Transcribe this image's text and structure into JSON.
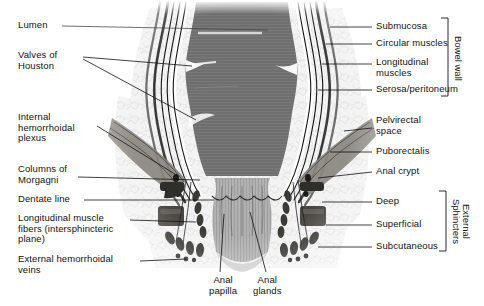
{
  "figure": {
    "background_color": "#ffffff",
    "ink_color": "#121212"
  },
  "labels_left": [
    {
      "id": "lumen",
      "text": "Lumen",
      "x": 18,
      "y": 22
    },
    {
      "id": "valves-of-houston",
      "text": "Valves of\nHouston",
      "x": 18,
      "y": 53
    },
    {
      "id": "internal-hemorrhoidal-plexus",
      "text": "Internal\nhemorrhoidal\nplexus",
      "x": 18,
      "y": 114
    },
    {
      "id": "columns-of-morgagni",
      "text": "Columns of\nMorgagni",
      "x": 18,
      "y": 166
    },
    {
      "id": "dentate-line",
      "text": "Dentate line",
      "x": 18,
      "y": 196
    },
    {
      "id": "longitudinal-muscle-fibers",
      "text": "Longitudinal muscle\nfibers (intersphincteric\nplane)",
      "x": 18,
      "y": 215
    },
    {
      "id": "external-hemorrhoidal-veins",
      "text": "External hemorrhoidal\nveins",
      "x": 18,
      "y": 256
    }
  ],
  "labels_right": [
    {
      "id": "submucosa",
      "text": "Submucosa",
      "x": 376,
      "y": 22
    },
    {
      "id": "circular-muscles",
      "text": "Circular muscles",
      "x": 376,
      "y": 39
    },
    {
      "id": "longitudinal-muscles",
      "text": "Longitudinal\nmuscles",
      "x": 376,
      "y": 58
    },
    {
      "id": "serosa-peritoneum",
      "text": "Serosa/peritoneum",
      "x": 376,
      "y": 85
    },
    {
      "id": "pelvirectal-space",
      "text": "Pelvirectal\nspace",
      "x": 376,
      "y": 116
    },
    {
      "id": "puborectalis",
      "text": "Puborectalis",
      "x": 376,
      "y": 147
    },
    {
      "id": "anal-crypt",
      "text": "Anal crypt",
      "x": 376,
      "y": 167
    },
    {
      "id": "deep",
      "text": "Deep",
      "x": 376,
      "y": 197
    },
    {
      "id": "superficial",
      "text": "Superficial",
      "x": 376,
      "y": 220
    },
    {
      "id": "subcutaneous",
      "text": "Subcutaneous",
      "x": 376,
      "y": 242
    }
  ],
  "labels_bottom": [
    {
      "id": "anal-papilla",
      "text": "Anal\npapilla",
      "x": 209,
      "y": 277
    },
    {
      "id": "anal-glands",
      "text": "Anal\nglands",
      "x": 253,
      "y": 277
    }
  ],
  "brackets": [
    {
      "id": "bowel-wall",
      "text": "Bowel wall",
      "x": 452,
      "y": 18,
      "height": 78
    },
    {
      "id": "external-sphincters",
      "text": "External\nSphincters",
      "x": 450,
      "y": 191,
      "height": 60
    }
  ],
  "colors": {
    "lumen_fill": "#6f6f6f",
    "mucosa_band": "#8a8a8a",
    "anal_canal": "#b0b0b0",
    "outer_tissue": "#efefef",
    "muscle_dark": "#3a3a36",
    "muscle_mid": "#6b6862",
    "levator": "#8e8b85",
    "stroke": "#121212",
    "highlight": "#ffffff"
  }
}
